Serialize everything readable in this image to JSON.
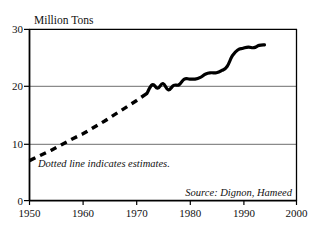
{
  "chart_data": {
    "type": "line",
    "title": "Million Tons",
    "xlabel": "",
    "ylabel": "Million Tons",
    "xlim": [
      1950,
      2000
    ],
    "ylim": [
      0,
      30
    ],
    "grid": true,
    "gridlines_y": [
      10,
      20
    ],
    "legend_position": "none",
    "x_ticks": [
      "1950",
      "1960",
      "1970",
      "1980",
      "1990",
      "2000"
    ],
    "x_tick_values": [
      1950,
      1960,
      1970,
      1980,
      1990,
      2000
    ],
    "y_ticks": [
      "0",
      "10",
      "20",
      "30"
    ],
    "y_tick_values": [
      0,
      10,
      20,
      30
    ],
    "annotations": [
      "Dotted line indicates estimates.",
      "Source: Dignon, Hameed"
    ],
    "series": [
      {
        "name": "Estimated emissions (dotted)",
        "style": "dashed",
        "x": [
          1950,
          1952,
          1954,
          1956,
          1958,
          1960,
          1962,
          1964,
          1966,
          1968,
          1970,
          1972
        ],
        "values": [
          7.0,
          7.9,
          8.8,
          9.8,
          10.8,
          11.7,
          12.8,
          13.9,
          15.1,
          16.3,
          17.5,
          18.8
        ]
      },
      {
        "name": "Measured emissions (solid)",
        "style": "solid",
        "x": [
          1972,
          1973,
          1974,
          1975,
          1976,
          1977,
          1978,
          1979,
          1980,
          1981,
          1982,
          1983,
          1984,
          1985,
          1986,
          1987,
          1988,
          1989,
          1990,
          1991,
          1992,
          1993,
          1994
        ],
        "values": [
          18.8,
          20.3,
          19.7,
          20.5,
          19.4,
          20.2,
          20.3,
          21.3,
          21.3,
          21.3,
          21.6,
          22.2,
          22.4,
          22.4,
          22.8,
          23.5,
          25.4,
          26.4,
          26.7,
          26.9,
          26.8,
          27.2,
          27.3
        ]
      }
    ]
  },
  "labels": {
    "axis_title": "Million Tons",
    "note": "Dotted line indicates estimates.",
    "source": "Source: Dignon, Hameed",
    "y0": "0",
    "y10": "10",
    "y20": "20",
    "y30": "30",
    "x1950": "1950",
    "x1960": "1960",
    "x1970": "1970",
    "x1980": "1980",
    "x1990": "1990",
    "x2000": "2000"
  },
  "colors": {
    "line": "#000000",
    "grid": "#8a8a8a",
    "frame": "#000000",
    "background": "#ffffff",
    "text": "#111111"
  }
}
